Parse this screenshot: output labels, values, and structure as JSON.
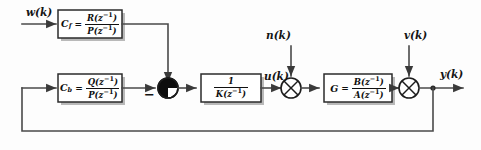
{
  "diagram": {
    "background_color": "#fdfdfd",
    "wire_color": "#4a4a4a",
    "block_border_color": "#2b2b2b"
  },
  "signals": {
    "reference": "w(k)",
    "control": "u(k)",
    "output": "y(k)",
    "disturbance_input": "n(k)",
    "disturbance_output": "v(k)",
    "negative_sign": "−"
  },
  "blocks": [
    {
      "id": "feedforward",
      "name": "C",
      "subscript": "f",
      "equals": "=",
      "numerator": "R(z",
      "numerator_exp": "−1",
      "numerator_tail": ")",
      "denominator": "P(z",
      "denominator_exp": "−1",
      "denominator_tail": ")",
      "label_full": "C_f = R(z^-1)/P(z^-1)"
    },
    {
      "id": "feedback",
      "name": "C",
      "subscript": "b",
      "equals": "=",
      "numerator": "Q(z",
      "numerator_exp": "−1",
      "numerator_tail": ")",
      "denominator": "P(z",
      "denominator_exp": "−1",
      "denominator_tail": ")",
      "label_full": "C_b = Q(z^-1)/P(z^-1)"
    },
    {
      "id": "inverse-gain",
      "name": "",
      "subscript": "",
      "equals": "",
      "numerator": "1",
      "numerator_exp": "",
      "numerator_tail": "",
      "denominator": "K(z",
      "denominator_exp": "−1",
      "denominator_tail": ")",
      "label_full": "1/K(z^-1)"
    },
    {
      "id": "plant",
      "name": "G",
      "subscript": "",
      "equals": "=",
      "numerator": "B(z",
      "numerator_exp": "−1",
      "numerator_tail": ")",
      "denominator": "A(z",
      "denominator_exp": "−1",
      "denominator_tail": ")",
      "label_full": "G = B(z^-1)/A(z^-1)"
    }
  ],
  "junctions": [
    {
      "id": "sum-control",
      "style": "filled-quadrants",
      "has_minus": true
    },
    {
      "id": "sum-input-disturbance",
      "style": "open-cross",
      "has_minus": false
    },
    {
      "id": "sum-output-disturbance",
      "style": "open-cross",
      "has_minus": false
    }
  ]
}
